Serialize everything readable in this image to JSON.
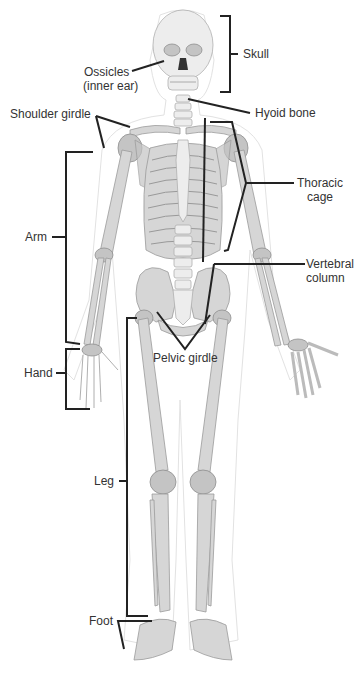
{
  "diagram": {
    "labels": {
      "skull": "Skull",
      "ossicles_line1": "Ossicles",
      "ossicles_line2": "(inner ear)",
      "hyoid": "Hyoid bone",
      "shoulder": "Shoulder girdle",
      "thoracic_line1": "Thoracic",
      "thoracic_line2": "cage",
      "arm": "Arm",
      "vertebral_line1": "Vertebral",
      "vertebral_line2": "column",
      "pelvic": "Pelvic girdle",
      "hand": "Hand",
      "leg": "Leg",
      "foot": "Foot"
    },
    "colors": {
      "bone": "#d6d6d6",
      "bone_shade": "#c4c4c4",
      "leader_line": "#222222",
      "text": "#333333",
      "background": "#ffffff"
    }
  }
}
